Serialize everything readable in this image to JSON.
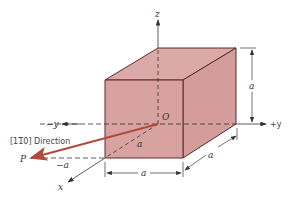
{
  "diagram": {
    "type": "unit-cell-cube-with-direction",
    "labels": {
      "z_axis": "z",
      "plus_y_axis": "+y",
      "minus_y_axis": "−y",
      "x_axis": "x",
      "origin": "O",
      "point_p": "P",
      "direction": "[1̅0] Direction",
      "direction_index_prefix": "[1",
      "direction_index_bar": "1",
      "direction_index_suffix": "0] Direction",
      "minus_a": "−a",
      "edge_a_vertical": "a",
      "edge_a_bottom": "a",
      "edge_a_depth": "a",
      "edge_a_diagonal": "a"
    },
    "colors": {
      "cube_fill": "#d9a3a3",
      "cube_edge": "#5a2a2a",
      "direction_vector": "#b04a3c",
      "axis_line": "#333333"
    }
  }
}
